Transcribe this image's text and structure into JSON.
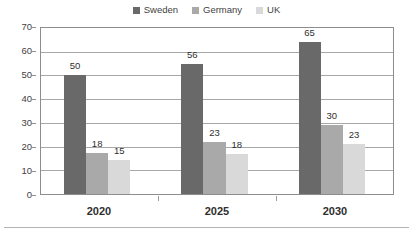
{
  "chart_data": {
    "type": "bar",
    "title": "",
    "subtitle": "",
    "xlabel": "",
    "ylabel": "",
    "categories": [
      "2020",
      "2025",
      "2030"
    ],
    "series": [
      {
        "name": "Sweden",
        "color": "#696969",
        "values": [
          50,
          56,
          65
        ]
      },
      {
        "name": "Germany",
        "color": "#a9a9a9",
        "values": [
          18,
          23,
          30
        ]
      },
      {
        "name": "UK",
        "color": "#d9d9d9",
        "values": [
          15,
          18,
          23
        ]
      }
    ],
    "ylim": [
      0,
      70
    ],
    "ytick_step": 10,
    "yticks": [
      "70",
      "60",
      "50",
      "40",
      "30",
      "20",
      "10",
      "0"
    ],
    "grid": true,
    "grid_axis": "y",
    "legend_position": "top-center",
    "data_labels": true
  },
  "legend": {
    "items": [
      {
        "label": "Sweden",
        "swatch": "#696969"
      },
      {
        "label": "Germany",
        "swatch": "#a9a9a9"
      },
      {
        "label": "UK",
        "swatch": "#d9d9d9"
      }
    ]
  },
  "axis": {
    "y_ticks": [
      "70",
      "60",
      "50",
      "40",
      "30",
      "20",
      "10",
      "0"
    ],
    "x_labels": [
      "2020",
      "2025",
      "2030"
    ]
  },
  "bars": {
    "g0": [
      {
        "value": "50",
        "series": "Sweden",
        "color": "#696969",
        "pct": 71.4
      },
      {
        "value": "18",
        "series": "Germany",
        "color": "#a9a9a9",
        "pct": 25.0
      },
      {
        "value": "15",
        "series": "UK",
        "color": "#d9d9d9",
        "pct": 20.3
      }
    ],
    "g1": [
      {
        "value": "56",
        "series": "Sweden",
        "color": "#696969",
        "pct": 78.6
      },
      {
        "value": "23",
        "series": "Germany",
        "color": "#a9a9a9",
        "pct": 31.1
      },
      {
        "value": "18",
        "series": "UK",
        "color": "#d9d9d9",
        "pct": 24.0
      }
    ],
    "g2": [
      {
        "value": "65",
        "series": "Sweden",
        "color": "#696969",
        "pct": 91.7
      },
      {
        "value": "30",
        "series": "Germany",
        "color": "#a9a9a9",
        "pct": 41.3
      },
      {
        "value": "23",
        "series": "UK",
        "color": "#d9d9d9",
        "pct": 30.2
      }
    ]
  },
  "colors": {
    "sweden": "#696969",
    "germany": "#a9a9a9",
    "uk": "#d9d9d9",
    "grid": "#a8a8a8",
    "frame": "#8d8d8d",
    "text": "#3f3f3f"
  }
}
